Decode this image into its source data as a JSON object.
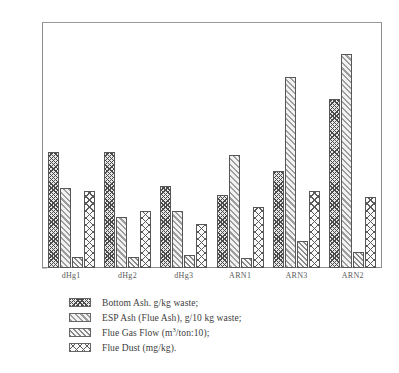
{
  "chart_data": {
    "type": "bar",
    "title": "",
    "xlabel": "",
    "ylabel": "",
    "ylim": [
      0,
      500
    ],
    "ytick_step": 50,
    "yticks": [
      0,
      50,
      100,
      150,
      200,
      250,
      300,
      350,
      400,
      450,
      500
    ],
    "grid": false,
    "legend_position": "below",
    "categories": [
      "dHg1",
      "dHg2",
      "dHg3",
      "ARN1",
      "ARN3",
      "ARN2"
    ],
    "series": [
      {
        "name": "Bottom Ash. g/kg waste;",
        "pattern": "cross-hatch-dark",
        "values": [
          237,
          237,
          168,
          150,
          197,
          345
        ]
      },
      {
        "name": "ESP Ash (Flue Ash), g/10 kg waste;",
        "pattern": "light-diagonal",
        "values": [
          163,
          105,
          117,
          230,
          390,
          437
        ]
      },
      {
        "name": "Flue Gas Flow (m3/ton:10);",
        "pattern": "diagonal-hatch",
        "values": [
          22,
          23,
          27,
          20,
          55,
          32
        ]
      },
      {
        "name": "Flue Dust (mg/kg).",
        "pattern": "cross-hatch-light",
        "values": [
          158,
          117,
          90,
          125,
          158,
          145
        ]
      }
    ]
  },
  "legend": {
    "items": [
      {
        "label": "Bottom Ash. g/kg waste;",
        "key": "bottom-ash"
      },
      {
        "label": "ESP Ash (Flue Ash), g/10 kg waste;",
        "key": "esp-ash"
      },
      {
        "label": "Flue Gas Flow (m",
        "unit_sup": "3",
        "label_tail": "/ton:10);",
        "key": "gas-flow"
      },
      {
        "label": "Flue Dust (mg/kg).",
        "key": "flue-dust"
      }
    ]
  },
  "colors": {
    "axis": "#8d8d8d",
    "bar_outline": "#575757",
    "text": "#3d3d3d",
    "background": "#ffffff"
  }
}
